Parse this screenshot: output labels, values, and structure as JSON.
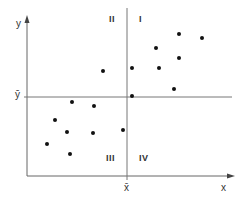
{
  "chart_data": {
    "type": "scatter",
    "title": "",
    "xlabel": "x",
    "ylabel": "y",
    "mean_lines": {
      "x_mean_label": "x̄",
      "y_mean_label": "ȳ"
    },
    "quadrants": {
      "I": "I",
      "II": "II",
      "III": "III",
      "IV": "IV"
    },
    "grid": false,
    "points_px": [
      [
        179,
        34
      ],
      [
        202,
        38
      ],
      [
        156,
        48
      ],
      [
        179,
        58
      ],
      [
        132,
        68
      ],
      [
        159,
        68
      ],
      [
        174,
        89
      ],
      [
        132,
        96
      ],
      [
        103,
        71
      ],
      [
        72,
        102
      ],
      [
        94,
        106
      ],
      [
        55,
        120
      ],
      [
        67,
        132
      ],
      [
        93,
        133
      ],
      [
        123,
        130
      ],
      [
        47,
        144
      ],
      [
        70,
        154
      ]
    ]
  },
  "colors": {
    "axis": "#555555",
    "point": "#111111",
    "text": "#333333"
  }
}
